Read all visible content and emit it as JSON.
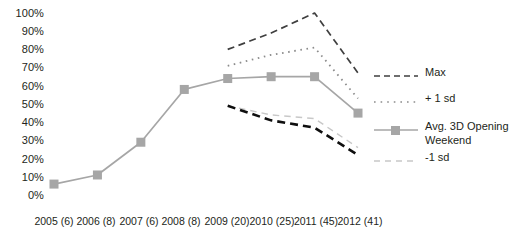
{
  "chart_data": {
    "type": "line",
    "title": "",
    "xlabel": "",
    "ylabel": "",
    "grid": false,
    "legend_position": "right",
    "ylim": [
      0,
      100
    ],
    "ytick_labels": [
      "100%",
      "90%",
      "80%",
      "70%",
      "60%",
      "50%",
      "40%",
      "30%",
      "20%",
      "10%",
      "0%"
    ],
    "ytick_values": [
      100,
      90,
      80,
      70,
      60,
      50,
      40,
      30,
      20,
      10,
      0
    ],
    "categories": [
      "2005 (6)",
      "2006 (8)",
      "2007 (6)",
      "2008 (8)",
      "2009 (20)",
      "2010 (25)",
      "2011 (45)",
      "2012 (41)"
    ],
    "series": [
      {
        "name": "Max",
        "style": "dashed",
        "color": "#3f3f3f",
        "values": [
          null,
          null,
          null,
          null,
          80,
          89,
          100,
          67
        ]
      },
      {
        "name": "+ 1 sd",
        "style": "dotted",
        "color": "#8c8c8c",
        "values": [
          null,
          null,
          null,
          null,
          71,
          77,
          81,
          53
        ]
      },
      {
        "name": "Avg. 3D Opening Weekend",
        "style": "solid-marker",
        "color": "#a6a6a6",
        "values": [
          6,
          11,
          29,
          58,
          64,
          65,
          65,
          45
        ]
      },
      {
        "name": "-1 sd",
        "style": "dashed-light",
        "color": "#c8c8c8",
        "values": [
          null,
          null,
          null,
          null,
          49,
          44,
          42,
          26
        ]
      },
      {
        "name": "Min",
        "style": "dashed-dark",
        "color": "#0f0f0f",
        "in_legend": false,
        "values": [
          null,
          null,
          null,
          null,
          49,
          41,
          37,
          22
        ]
      }
    ]
  },
  "legend": {
    "entries": [
      {
        "label": "Max",
        "swatch": "dashed-line-swatch"
      },
      {
        "label": "+ 1 sd",
        "swatch": "dotted-line-swatch"
      },
      {
        "label": "Avg. 3D Opening\nWeekend",
        "swatch": "solid-marker-line-swatch"
      },
      {
        "label": "-1 sd",
        "swatch": "light-dashed-line-swatch"
      }
    ]
  }
}
